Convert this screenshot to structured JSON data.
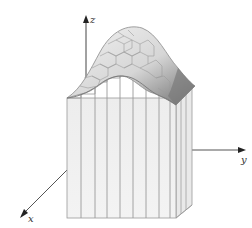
{
  "figure": {
    "axes": {
      "x_label": "x",
      "y_label": "y",
      "z_label": "z"
    },
    "colors": {
      "background": "#ffffff",
      "axis": "#444444",
      "prism_face": "#efefef",
      "prism_edge": "#999999",
      "surface_light": "#e4e4e4",
      "surface_dark": "#7a7a7a"
    }
  }
}
